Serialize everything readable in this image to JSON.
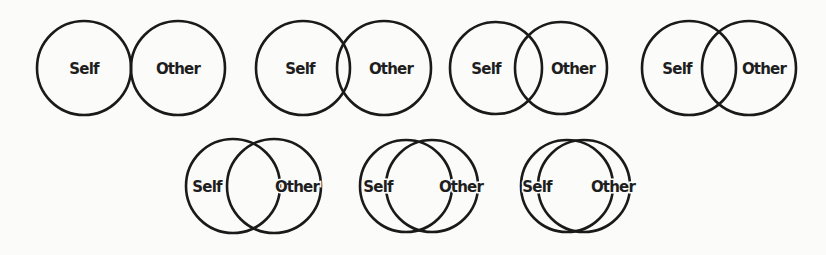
{
  "diagram": {
    "type": "Inclusion of Other in the Self scale",
    "labels": {
      "self": "Self",
      "other": "Other"
    },
    "stroke_color": "#1a1a1a",
    "background": "#fbfbfa",
    "items": [
      {
        "id": 1,
        "self": "Self",
        "other": "Other",
        "cx1": 84,
        "cx2": 178,
        "cy": 68,
        "r": 47,
        "tx1": 84,
        "tx2": 178
      },
      {
        "id": 2,
        "self": "Self",
        "other": "Other",
        "cx1": 303,
        "cx2": 384,
        "cy": 68,
        "r": 47,
        "tx1": 300,
        "tx2": 391
      },
      {
        "id": 3,
        "self": "Self",
        "other": "Other",
        "cx1": 496,
        "cx2": 561,
        "cy": 68,
        "r": 46,
        "tx1": 486,
        "tx2": 573
      },
      {
        "id": 4,
        "self": "Self",
        "other": "Other",
        "cx1": 689,
        "cx2": 749,
        "cy": 68,
        "r": 47,
        "tx1": 677,
        "tx2": 764
      },
      {
        "id": 5,
        "self": "Self",
        "other": "Other",
        "cx1": 233,
        "cx2": 274,
        "cy": 186,
        "r": 47,
        "tx1": 207,
        "tx2": 297
      },
      {
        "id": 6,
        "self": "Self",
        "other": "Other",
        "cx1": 406,
        "cx2": 432,
        "cy": 186,
        "r": 46,
        "tx1": 378,
        "tx2": 461
      },
      {
        "id": 7,
        "self": "Self",
        "other": "Other",
        "cx1": 567,
        "cx2": 584,
        "cy": 186,
        "r": 46,
        "tx1": 537,
        "tx2": 613
      }
    ]
  }
}
